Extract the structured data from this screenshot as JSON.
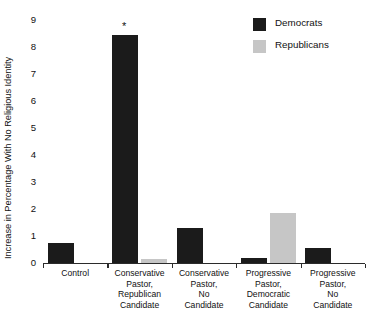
{
  "chart_data": {
    "type": "bar",
    "title": "",
    "xlabel": "",
    "ylabel": "Increase in Percentage With No Religious Identity",
    "ylim": [
      0,
      9
    ],
    "ytick_labels": [
      "0",
      "1",
      "2",
      "3",
      "4",
      "5",
      "6",
      "7",
      "8",
      "9"
    ],
    "ytick_values": [
      0,
      1,
      2,
      3,
      4,
      5,
      6,
      7,
      8,
      9
    ],
    "grid": false,
    "legend_position": "top-right",
    "categories": [
      "Control",
      "Conservative Pastor, Republican Candidate",
      "Conservative Pastor, No Candidate",
      "Progressive Pastor, Democratic Candidate",
      "Progressive Pastor, No Candidate"
    ],
    "category_label_lines": [
      [
        "Control"
      ],
      [
        "Conservative",
        "Pastor,",
        "Republican",
        "Candidate"
      ],
      [
        "Conservative",
        "Pastor,",
        "No",
        "Candidate"
      ],
      [
        "Progressive",
        "Pastor,",
        "Democratic",
        "Candidate"
      ],
      [
        "Progressive",
        "Pastor,",
        "No",
        "Candidate"
      ]
    ],
    "series": [
      {
        "name": "Democrats",
        "color": "#1b1b1b",
        "values": [
          0.75,
          8.45,
          1.3,
          0.2,
          0.55
        ]
      },
      {
        "name": "Republicans",
        "color": "#c6c6c6",
        "values": [
          0.0,
          0.15,
          0.0,
          1.85,
          0.0
        ]
      }
    ],
    "annotations": [
      {
        "text": "*",
        "category": "Conservative Pastor, Republican Candidate",
        "series": "Democrats",
        "value": 8.45
      }
    ]
  },
  "legend": {
    "items": [
      {
        "label": "Democrats",
        "color": "#1b1b1b"
      },
      {
        "label": "Republicans",
        "color": "#c6c6c6"
      }
    ]
  }
}
